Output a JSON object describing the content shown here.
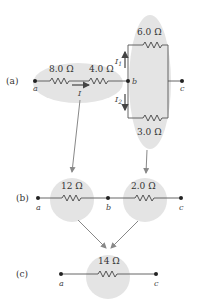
{
  "diagram": {
    "colors": {
      "highlight": "#e4e4e4",
      "wire": "#555555",
      "arrow": "#888888",
      "current_arrow": "#444444"
    },
    "panel_a": {
      "label": "(a)",
      "nodes": {
        "a": "a",
        "b": "b",
        "c": "c"
      },
      "series_resistors": [
        {
          "value": "8.0 Ω"
        },
        {
          "value": "4.0 Ω"
        }
      ],
      "parallel_resistors": [
        {
          "value": "6.0 Ω"
        },
        {
          "value": "3.0 Ω"
        }
      ],
      "currents": {
        "main": "I",
        "branch1": "I",
        "branch1_sub": "1",
        "branch2": "I",
        "branch2_sub": "2"
      }
    },
    "panel_b": {
      "label": "(b)",
      "nodes": {
        "a": "a",
        "b": "b",
        "c": "c"
      },
      "resistors": [
        {
          "value": "12 Ω"
        },
        {
          "value": "2.0 Ω"
        }
      ]
    },
    "panel_c": {
      "label": "(c)",
      "nodes": {
        "a": "a",
        "c": "c"
      },
      "resistors": [
        {
          "value": "14 Ω"
        }
      ]
    }
  }
}
